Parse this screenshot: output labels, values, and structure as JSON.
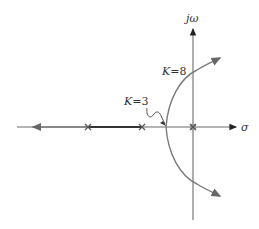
{
  "diagram": {
    "type": "root-locus",
    "axes": {
      "real_label": "σ",
      "imag_label": "jω"
    },
    "poles": [
      "pole-left",
      "pole-mid",
      "pole-origin"
    ],
    "annotations": {
      "k_cross": {
        "var": "K",
        "eq": "=",
        "val": "8"
      },
      "k_break": {
        "var": "K",
        "eq": "=",
        "val": "3"
      }
    },
    "colors": {
      "axis": "#6a6a6a",
      "locus": "#7a7a7a",
      "locus_segment": "#333333"
    }
  }
}
